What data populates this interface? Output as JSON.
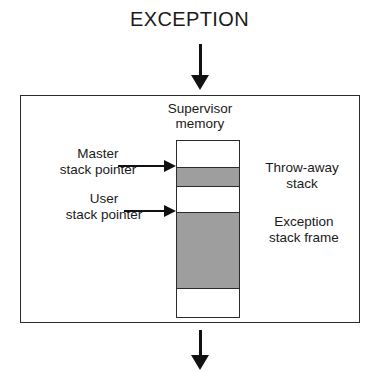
{
  "diagram": {
    "title": "EXCEPTION",
    "supervisor_memory_label_line1": "Supervisor",
    "supervisor_memory_label_line2": "memory",
    "colors": {
      "shaded_band": "#9E9E9E",
      "stroke": "#2B2B2B",
      "arrow": "#111111",
      "background": "#FFFFFF",
      "text": "#1A1A1A"
    },
    "arrows": {
      "incoming_label": "exception-entry-arrow",
      "outgoing_label": "exception-exit-arrow"
    },
    "pointers": [
      {
        "id": "master-stack-pointer",
        "line1": "Master",
        "line2": "stack pointer"
      },
      {
        "id": "user-stack-pointer",
        "line1": "User",
        "line2": "stack pointer"
      }
    ],
    "regions": [
      {
        "id": "throw-away-stack",
        "line1": "Throw-away",
        "line2": "stack"
      },
      {
        "id": "exception-stack-frame",
        "line1": "Exception",
        "line2": "stack frame"
      }
    ],
    "memory_bands": [
      {
        "id": "band-free-top",
        "fill": "white"
      },
      {
        "id": "band-throw-away-stack",
        "fill": "shaded"
      },
      {
        "id": "band-gap",
        "fill": "white"
      },
      {
        "id": "band-exception-stack-frame",
        "fill": "shaded"
      },
      {
        "id": "band-free-bottom",
        "fill": "white"
      }
    ]
  }
}
